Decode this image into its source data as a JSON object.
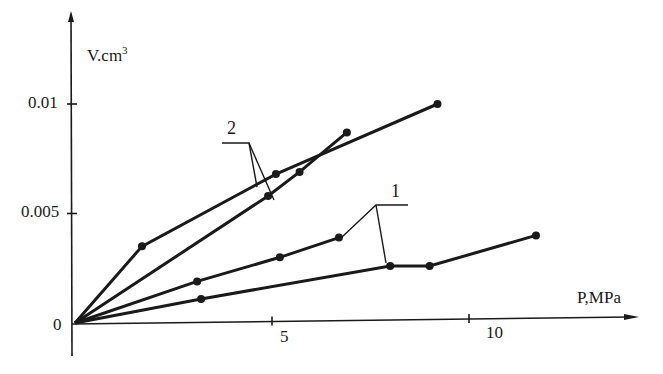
{
  "chart_data": {
    "type": "line",
    "title": "",
    "xlabel": "P,MPa",
    "ylabel": "V.cm³",
    "ylabel_base": "V.cm",
    "ylabel_sup": "3",
    "xlim": [
      0,
      13
    ],
    "ylim": [
      0,
      0.013
    ],
    "grid": false,
    "x_ticks": [
      0,
      5,
      10
    ],
    "x_tick_labels": [
      "0",
      "5",
      "10"
    ],
    "y_ticks": [
      0,
      0.005,
      0.01
    ],
    "y_tick_labels": [
      "0",
      "0.005",
      "0.01"
    ],
    "origin_label": "0",
    "series": [
      {
        "name": "2",
        "group": "2",
        "x": [
          0,
          1.7,
          5.1,
          9.2
        ],
        "y": [
          0,
          0.0035,
          0.0068,
          0.01
        ]
      },
      {
        "name": "2",
        "group": "2",
        "x": [
          0,
          4.9,
          5.7,
          6.9
        ],
        "y": [
          0,
          0.0058,
          0.0069,
          0.0087
        ]
      },
      {
        "name": "1",
        "group": "1",
        "x": [
          0,
          3.1,
          5.2,
          6.7
        ],
        "y": [
          0,
          0.0019,
          0.003,
          0.0039
        ]
      },
      {
        "name": "1",
        "group": "1",
        "x": [
          0,
          3.2,
          8.0,
          9.0,
          11.7
        ],
        "y": [
          0,
          0.0011,
          0.0026,
          0.0026,
          0.004
        ]
      }
    ],
    "annotations": [
      {
        "text": "2",
        "points_to": "both curves of group 2"
      },
      {
        "text": "1",
        "points_to": "both curves of group 1"
      }
    ],
    "legend": "none (curves labelled by leader-line callouts)"
  },
  "colors": {
    "ink": "#1a1a1a",
    "background": "#ffffff"
  }
}
